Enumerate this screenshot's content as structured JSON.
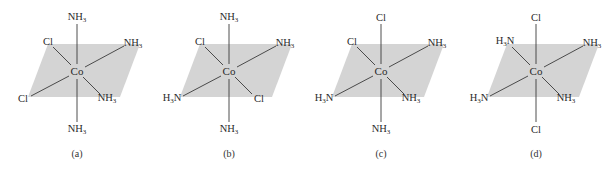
{
  "figure": {
    "colors": {
      "plane_fill": "#d4d4d4",
      "bond_line": "#3a3a3a",
      "text": "#2a2a2a"
    },
    "panels": [
      {
        "caption": "(a)",
        "center": "Co",
        "ligands": {
          "top": "NH3",
          "bottom": "NH3",
          "back_left": "Cl",
          "back_right": "NH3",
          "front_left": "Cl",
          "front_right": "NH3"
        }
      },
      {
        "caption": "(b)",
        "center": "Co",
        "ligands": {
          "top": "NH3",
          "bottom": "NH3",
          "back_left": "Cl",
          "back_right": "NH3",
          "front_left": "H3N",
          "front_right": "Cl"
        }
      },
      {
        "caption": "(c)",
        "center": "Co",
        "ligands": {
          "top": "Cl",
          "bottom": "NH3",
          "back_left": "Cl",
          "back_right": "NH3",
          "front_left": "H3N",
          "front_right": "NH3"
        }
      },
      {
        "caption": "(d)",
        "center": "Co",
        "ligands": {
          "top": "Cl",
          "bottom": "Cl",
          "back_left": "H3N",
          "back_right": "NH3",
          "front_left": "H3N",
          "front_right": "NH3"
        }
      }
    ]
  }
}
